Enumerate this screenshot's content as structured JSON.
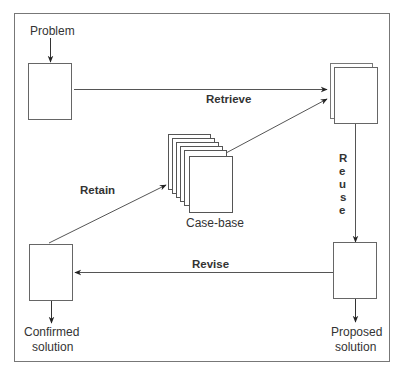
{
  "diagram": {
    "type": "cycle",
    "nodes": {
      "problem": {
        "label": "Problem"
      },
      "retrieved": {
        "label": ""
      },
      "case_base": {
        "label": "Case-base"
      },
      "proposed": {
        "label_line1": "Proposed",
        "label_line2": "solution"
      },
      "confirmed": {
        "label_line1": "Confirmed",
        "label_line2": "solution"
      }
    },
    "edges": {
      "retrieve": {
        "label": "Retrieve",
        "from": "problem",
        "to": "retrieved"
      },
      "retrieve_case": {
        "label": "",
        "from": "case_base",
        "to": "retrieved"
      },
      "reuse": {
        "label": "Reuse",
        "letters": [
          "R",
          "e",
          "u",
          "s",
          "e"
        ],
        "from": "retrieved",
        "to": "proposed"
      },
      "revise": {
        "label": "Revise",
        "from": "proposed",
        "to": "confirmed"
      },
      "retain": {
        "label": "Retain",
        "from": "confirmed",
        "to": "case_base"
      }
    },
    "colors": {
      "stroke": "#555555",
      "text": "#333333",
      "background": "#ffffff"
    }
  }
}
